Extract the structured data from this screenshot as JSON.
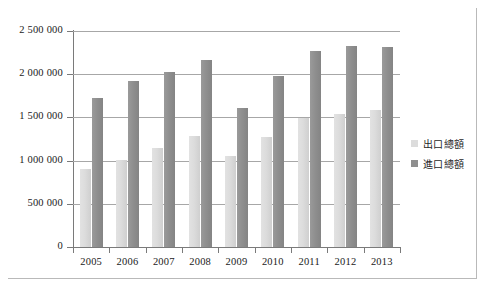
{
  "chart_data": {
    "type": "bar",
    "title": "",
    "xlabel": "",
    "ylabel": "",
    "categories": [
      "2005",
      "2006",
      "2007",
      "2008",
      "2009",
      "2010",
      "2011",
      "2012",
      "2013"
    ],
    "series": [
      {
        "name": "出口總額",
        "values": [
          900000,
          1005000,
          1150000,
          1285000,
          1050000,
          1270000,
          1495000,
          1545000,
          1590000
        ],
        "color": "#dcdcdc"
      },
      {
        "name": "進口總額",
        "values": [
          1720000,
          1920000,
          2020000,
          2165000,
          1605000,
          1975000,
          2265000,
          2325000,
          2320000
        ],
        "color": "#8f8f8f"
      }
    ],
    "ylim": [
      0,
      2500000
    ],
    "ytick_values": [
      0,
      500000,
      1000000,
      1500000,
      2000000,
      2500000
    ],
    "ytick_labels": [
      "0",
      "500 000",
      "1 000 000",
      "1 500 000",
      "2 000 000",
      "2 500 000"
    ],
    "grid": true,
    "legend_position": "right"
  },
  "legend": {
    "items": [
      {
        "label": "出口總額",
        "color": "#dcdcdc"
      },
      {
        "label": "進口總額",
        "color": "#8f8f8f"
      }
    ]
  }
}
